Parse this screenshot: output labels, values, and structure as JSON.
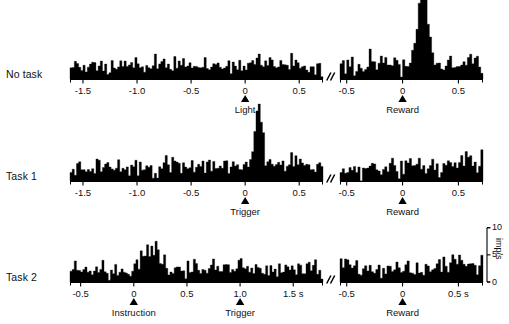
{
  "figure": {
    "title_visible": "",
    "ink_color": "#000000",
    "background": "#ffffff",
    "break_symbol": "//"
  },
  "rows": [
    {
      "id": "no-task",
      "label": "No task",
      "baseline_y": 79,
      "left_panel": {
        "id": "no-task-light",
        "x_start": 70,
        "x_end": 323,
        "t_min": -1.62,
        "t_max": 0.72,
        "bin_width_s": 0.02,
        "ticks": [
          {
            "value": -1.5,
            "label": "-1.5"
          },
          {
            "value": -1.0,
            "label": "-1.0"
          },
          {
            "value": -0.5,
            "label": "-0.5"
          },
          {
            "value": 0.0,
            "label": "0"
          },
          {
            "value": 0.5,
            "label": "0.5"
          }
        ],
        "event": {
          "time": 0.0,
          "label": "Light"
        },
        "baseline_rate": 4.3,
        "noise": 1.5,
        "seed": 1171,
        "peaks": [
          {
            "center": 0.13,
            "width": 0.055,
            "amplitude": 2.1,
            "shape": "gauss"
          }
        ]
      },
      "right_panel": {
        "id": "no-task-reward",
        "x_start": 340,
        "x_end": 483,
        "t_min": -0.56,
        "t_max": 0.72,
        "bin_width_s": 0.02,
        "ticks": [
          {
            "value": -0.5,
            "label": "-0.5"
          },
          {
            "value": 0.0,
            "label": "0"
          },
          {
            "value": 0.5,
            "label": "0.5"
          }
        ],
        "event": {
          "time": 0.0,
          "label": "Reward"
        },
        "baseline_rate": 4.6,
        "noise": 1.8,
        "seed": 2287,
        "peaks": [
          {
            "center": 0.185,
            "width": 0.032,
            "amplitude": 31.0,
            "shape": "gauss"
          },
          {
            "center": 0.185,
            "width": 0.085,
            "amplitude": 4.5,
            "shape": "gauss"
          }
        ]
      }
    },
    {
      "id": "task-1",
      "label": "Task 1",
      "baseline_y": 181,
      "left_panel": {
        "id": "task-1-trigger",
        "x_start": 70,
        "x_end": 323,
        "t_min": -1.62,
        "t_max": 0.72,
        "bin_width_s": 0.02,
        "ticks": [
          {
            "value": -1.5,
            "label": "-1.5"
          },
          {
            "value": -1.0,
            "label": "-1.0"
          },
          {
            "value": -0.5,
            "label": "-0.5"
          },
          {
            "value": 0.0,
            "label": "0"
          },
          {
            "value": 0.5,
            "label": "0.5"
          }
        ],
        "event": {
          "time": 0.0,
          "label": "Trigger"
        },
        "baseline_rate": 4.5,
        "noise": 1.6,
        "seed": 3391,
        "peaks": [
          {
            "center": 0.125,
            "width": 0.03,
            "amplitude": 18.0,
            "shape": "gauss"
          },
          {
            "center": 0.125,
            "width": 0.075,
            "amplitude": 4.0,
            "shape": "gauss"
          }
        ]
      },
      "right_panel": {
        "id": "task-1-reward",
        "x_start": 340,
        "x_end": 483,
        "t_min": -0.56,
        "t_max": 0.72,
        "bin_width_s": 0.02,
        "ticks": [
          {
            "value": -0.5,
            "label": "-0.5"
          },
          {
            "value": 0.0,
            "label": "0"
          },
          {
            "value": 0.5,
            "label": "0.5"
          }
        ],
        "event": {
          "time": 0.0,
          "label": "Reward"
        },
        "baseline_rate": 4.2,
        "noise": 1.7,
        "seed": 4457,
        "peaks": [
          {
            "center": 0.6,
            "width": 0.055,
            "amplitude": 3.6,
            "shape": "gauss"
          }
        ]
      }
    },
    {
      "id": "task-2",
      "label": "Task 2",
      "baseline_y": 282,
      "left_panel": {
        "id": "task-2-instruction",
        "x_start": 70,
        "x_end": 323,
        "t_min": -0.6,
        "t_max": 1.78,
        "bin_width_s": 0.02,
        "ticks": [
          {
            "value": -0.5,
            "label": "-0.5"
          },
          {
            "value": 0.0,
            "label": "0"
          },
          {
            "value": 0.5,
            "label": "0.5"
          },
          {
            "value": 1.0,
            "label": "1.0"
          },
          {
            "value": 1.5,
            "label": "1.5 s"
          }
        ],
        "events": [
          {
            "time": 0.0,
            "label": "Instruction"
          },
          {
            "time": 1.0,
            "label": "Trigger"
          }
        ],
        "baseline_rate": 4.2,
        "noise": 1.5,
        "seed": 5521,
        "peaks": [
          {
            "center": 0.165,
            "width": 0.07,
            "amplitude": 7.4,
            "shape": "gauss"
          }
        ]
      },
      "right_panel": {
        "id": "task-2-reward",
        "x_start": 340,
        "x_end": 483,
        "t_min": -0.56,
        "t_max": 0.72,
        "bin_width_s": 0.02,
        "ticks": [
          {
            "value": -0.5,
            "label": "-0.5"
          },
          {
            "value": 0.0,
            "label": "0"
          },
          {
            "value": 0.5,
            "label": "0.5 s"
          }
        ],
        "event": {
          "time": 0.0,
          "label": "Reward"
        },
        "baseline_rate": 4.4,
        "noise": 1.6,
        "seed": 6619,
        "peaks": [
          {
            "center": 0.5,
            "width": 0.075,
            "amplitude": 4.2,
            "shape": "gauss"
          },
          {
            "center": -0.48,
            "width": 0.035,
            "amplitude": 2.6,
            "shape": "gauss"
          }
        ]
      }
    }
  ],
  "scale_bar": {
    "id": "rate-scale",
    "x": 487,
    "baseline_y": 282,
    "units": "imp/s",
    "ticks": [
      {
        "value": 0,
        "label": "0"
      },
      {
        "value": 5,
        "label": "5"
      },
      {
        "value": 10,
        "label": "10"
      }
    ],
    "max_value": 10
  },
  "scaling": {
    "px_per_imp_s": 3.05,
    "row_max_clip_px": 86
  },
  "chart_data": {
    "type": "bar",
    "xlabel": "Time (s)",
    "ylabel": "imp/s",
    "ylim": [
      0,
      10
    ],
    "grid": false,
    "legend": "none",
    "bin_width_s": 0.02,
    "panels": [
      {
        "row": "No task",
        "alignment": "Light",
        "x_range": [
          -1.62,
          0.72
        ],
        "xticks": [
          -1.5,
          -1.0,
          -0.5,
          0,
          0.5
        ],
        "baseline_rate_imp_s": 4.3,
        "peak_rate_imp_s": 6.4,
        "peak_time_s": 0.13,
        "description": "flat, essentially no modulation; slight broad bump just after light"
      },
      {
        "row": "No task",
        "alignment": "Reward",
        "x_range": [
          -0.56,
          0.72
        ],
        "xticks": [
          -0.5,
          0,
          0.5
        ],
        "baseline_rate_imp_s": 4.6,
        "peak_rate_imp_s": 36.0,
        "peak_time_s": 0.185,
        "description": "large sharp phasic burst ~180 ms after reward delivery"
      },
      {
        "row": "Task 1",
        "alignment": "Trigger",
        "x_range": [
          -1.62,
          0.72
        ],
        "xticks": [
          -1.5,
          -1.0,
          -0.5,
          0,
          0.5
        ],
        "baseline_rate_imp_s": 4.5,
        "peak_rate_imp_s": 23.0,
        "peak_time_s": 0.125,
        "description": "sharp phasic burst ~125 ms after trigger stimulus"
      },
      {
        "row": "Task 1",
        "alignment": "Reward",
        "x_range": [
          -0.56,
          0.72
        ],
        "xticks": [
          -0.5,
          0,
          0.5
        ],
        "baseline_rate_imp_s": 4.2,
        "peak_rate_imp_s": 8.0,
        "peak_time_s": 0.6,
        "description": "no clear reward response; small late fluctuation"
      },
      {
        "row": "Task 2",
        "alignment": "Instruction",
        "x_range": [
          -0.6,
          1.78
        ],
        "xticks": [
          -0.5,
          0,
          0.5,
          1.0,
          1.5
        ],
        "second_event": {
          "label": "Trigger",
          "time_s": 1.0
        },
        "baseline_rate_imp_s": 4.2,
        "peak_rate_imp_s": 11.5,
        "peak_time_s": 0.165,
        "description": "moderate broad response after instruction; no response at trigger"
      },
      {
        "row": "Task 2",
        "alignment": "Reward",
        "x_range": [
          -0.56,
          0.72
        ],
        "xticks": [
          -0.5,
          0,
          0.5
        ],
        "baseline_rate_imp_s": 4.4,
        "peak_rate_imp_s": 9.0,
        "peak_time_s": 0.5,
        "description": "weak late elevation around 0.45-0.55 s"
      }
    ]
  }
}
